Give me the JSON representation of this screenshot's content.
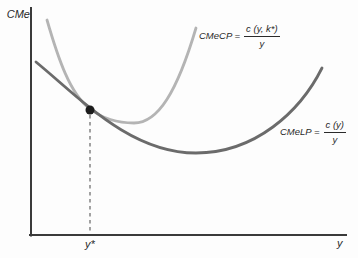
{
  "figure": {
    "background": "#fdfdfd",
    "text_color": "#2a2a2a",
    "axis_color": "#3a3a3a",
    "y_axis_label": "CMe",
    "x_axis_label": "y",
    "x_tick_label": "y*",
    "axes": {
      "y_axis_path": "M 31,8 L 31,235.5",
      "x_axis_path": "M 30,235 L 346,235"
    },
    "curves": [
      {
        "id": "cmecp",
        "semantic": "short-run-average-cost-curve",
        "color": "#b4b4b4",
        "width": 2.8,
        "path": "M 47,20 C 58,58 70,94 90,109 C 104,119.5 118,123 134,123 C 158,123 177,92 196,28"
      },
      {
        "id": "cmelp",
        "semantic": "long-run-average-cost-curve",
        "color": "#6b6b6b",
        "width": 2.8,
        "path": "M 36,62 C 80,98 130,153 196,153 C 255,153 300,112 322,68"
      }
    ],
    "tangency_point": {
      "cx": 90,
      "cy": 110,
      "r": 4.5,
      "color": "#1c1c1c"
    },
    "dashed_line": {
      "path": "M 90,115 L 90,233",
      "color": "#666666",
      "dash": "3.5 3.5",
      "width": 1.2
    },
    "labels": {
      "cmecp": {
        "lhs": "CMeCP =",
        "num": "c (y, k*)",
        "den": "y"
      },
      "cmelp": {
        "lhs": "CMeLP =",
        "num": "c (y)",
        "den": "y"
      }
    }
  },
  "chart_data": {
    "type": "line",
    "title": "",
    "xlabel": "y",
    "ylabel": "CMe",
    "x_axis_ticks": [
      "y*"
    ],
    "grid": false,
    "legend_position": "inline-annotations",
    "series": [
      {
        "name": "CMeCP = c(y, k*)/y",
        "description": "Short-run (capital fixed at k*) average cost: steep U-shaped light gray curve",
        "color": "#b4b4b4",
        "points_fraction_of_axes": [
          [
            0.051,
            0.947
          ],
          [
            0.108,
            0.714
          ],
          [
            0.187,
            0.555
          ],
          [
            0.327,
            0.493
          ],
          [
            0.431,
            0.597
          ],
          [
            0.524,
            0.912
          ]
        ]
      },
      {
        "name": "CMeLP = c(y)/y",
        "description": "Long-run average cost: flatter U-shaped dark gray curve, lower envelope",
        "color": "#6b6b6b",
        "points_fraction_of_axes": [
          [
            0.016,
            0.762
          ],
          [
            0.194,
            0.551
          ],
          [
            0.295,
            0.449
          ],
          [
            0.524,
            0.361
          ],
          [
            0.768,
            0.476
          ],
          [
            0.924,
            0.736
          ]
        ]
      }
    ],
    "annotations": [
      {
        "type": "point",
        "label": "tangency of CMeCP and CMeLP",
        "x_fraction": 0.187,
        "y_fraction": 0.555,
        "marker": "filled-black-dot",
        "dashed_drop_line_to_x_axis_at": "y*"
      }
    ]
  }
}
